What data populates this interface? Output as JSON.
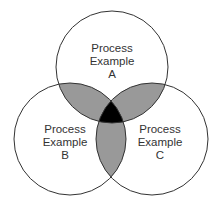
{
  "diagram": {
    "type": "venn",
    "colors": {
      "outline": "#333333",
      "pair_overlap": "#999999",
      "triple_overlap": "#000000",
      "background": "#ffffff"
    },
    "sets": [
      {
        "id": "A",
        "lines": [
          "Process",
          "Example",
          "A"
        ]
      },
      {
        "id": "B",
        "lines": [
          "Process",
          "Example",
          "B"
        ]
      },
      {
        "id": "C",
        "lines": [
          "Process",
          "Example",
          "C"
        ]
      }
    ]
  }
}
